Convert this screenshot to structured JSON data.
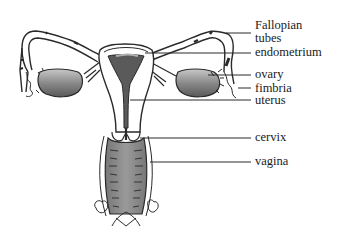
{
  "diagram": {
    "colors": {
      "outline": "#2a2a2a",
      "shading_dark": "#555555",
      "shading_mid": "#8a8a8a",
      "shading_light": "#bdbdbd",
      "background": "#ffffff"
    },
    "labels": [
      {
        "id": "fallopian",
        "line1": "Fallopian",
        "line2": "tubes"
      },
      {
        "id": "endometrium",
        "text": "endometrium"
      },
      {
        "id": "ovary",
        "text": "ovary"
      },
      {
        "id": "fimbria",
        "text": "fimbria"
      },
      {
        "id": "uterus",
        "text": "uterus"
      },
      {
        "id": "cervix",
        "text": "cervix"
      },
      {
        "id": "vagina",
        "text": "vagina"
      }
    ]
  }
}
